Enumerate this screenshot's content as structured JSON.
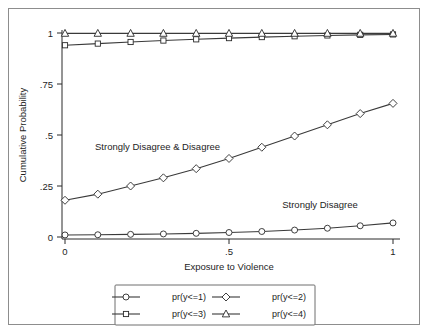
{
  "chart_data": {
    "type": "line",
    "title": "",
    "xlabel": "Exposure to Violence",
    "ylabel": "Cumulative Probability",
    "xlim": [
      0,
      1
    ],
    "ylim": [
      0,
      1
    ],
    "xticks": [
      0,
      0.5,
      1
    ],
    "xticklabels": [
      "0",
      ".5",
      "1"
    ],
    "yticks": [
      0,
      0.25,
      0.5,
      0.75,
      1
    ],
    "yticklabels": [
      "0",
      ".25",
      ".5",
      ".75",
      "1"
    ],
    "grid": false,
    "legend_position": "below-plot",
    "x": [
      0,
      0.1,
      0.2,
      0.3,
      0.4,
      0.5,
      0.6,
      0.7,
      0.8,
      0.9,
      1
    ],
    "series": [
      {
        "name": "pr(y<=1)",
        "marker": "circle",
        "values": [
          0.01,
          0.011,
          0.013,
          0.015,
          0.018,
          0.022,
          0.027,
          0.034,
          0.043,
          0.055,
          0.069
        ]
      },
      {
        "name": "pr(y<=2)",
        "marker": "diamond",
        "values": [
          0.18,
          0.21,
          0.25,
          0.29,
          0.335,
          0.385,
          0.44,
          0.495,
          0.55,
          0.605,
          0.655
        ]
      },
      {
        "name": "pr(y<=3)",
        "marker": "square",
        "values": [
          0.94,
          0.948,
          0.956,
          0.963,
          0.969,
          0.975,
          0.98,
          0.984,
          0.988,
          0.991,
          0.993
        ]
      },
      {
        "name": "pr(y<=4)",
        "marker": "triangle",
        "values": [
          0.998,
          0.998,
          0.998,
          0.998,
          0.998,
          0.998,
          0.998,
          0.998,
          0.998,
          0.998,
          0.998
        ]
      }
    ],
    "annotations": [
      {
        "text": "Strongly Disagree & Disagree",
        "x": 0.185,
        "y": 0.425
      },
      {
        "text": "Strongly Disagree",
        "x": 0.775,
        "y": 0.145
      }
    ],
    "legend": {
      "entries": [
        {
          "label": "pr(y<=1)",
          "marker": "circle"
        },
        {
          "label": "pr(y<=2)",
          "marker": "diamond"
        },
        {
          "label": "pr(y<=3)",
          "marker": "square"
        },
        {
          "label": "pr(y<=4)",
          "marker": "triangle"
        }
      ]
    },
    "colors": {
      "line": "#3a3a3a",
      "axis": "#2a2a2a",
      "frame": "#8d8d8d",
      "background": "#ffffff",
      "marker_fill": "#ffffff"
    }
  }
}
